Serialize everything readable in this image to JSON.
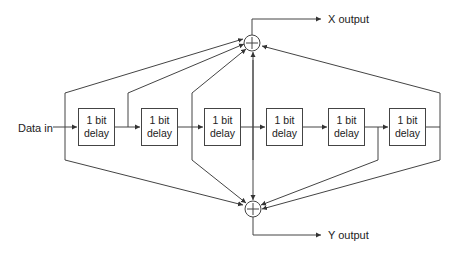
{
  "diagram": {
    "input_label": "Data in",
    "delays": [
      {
        "line1": "1 bit",
        "line2": "delay"
      },
      {
        "line1": "1 bit",
        "line2": "delay"
      },
      {
        "line1": "1 bit",
        "line2": "delay"
      },
      {
        "line1": "1 bit",
        "line2": "delay"
      },
      {
        "line1": "1 bit",
        "line2": "delay"
      },
      {
        "line1": "1 bit",
        "line2": "delay"
      }
    ],
    "adders": [
      {
        "symbol": "+",
        "output": "X output"
      },
      {
        "symbol": "+",
        "output": "Y output"
      }
    ],
    "colors": {
      "stroke": "#444444",
      "text": "#222222",
      "background": "#ffffff"
    }
  }
}
